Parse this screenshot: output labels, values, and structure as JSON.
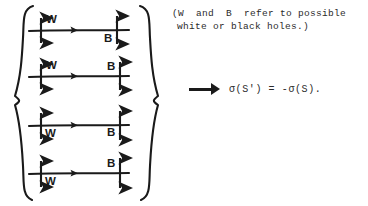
{
  "figure": {
    "left_brace": "{",
    "right_brace": "}",
    "rows": [
      {
        "id": "row-1",
        "left_label": "W",
        "right_label": "B",
        "left_label_position": "above",
        "right_label_position": "below",
        "horizontal_arrow": "rightwards-arrowhead"
      },
      {
        "id": "row-2",
        "left_label": "W",
        "right_label": "B",
        "left_label_position": "above",
        "right_label_position": "above",
        "horizontal_arrow": "rightwards-arrowhead"
      },
      {
        "id": "row-3",
        "left_label": "W",
        "right_label": "B",
        "left_label_position": "below",
        "right_label_position": "below",
        "horizontal_arrow": "rightwards-arrowhead"
      },
      {
        "id": "row-4",
        "left_label": "W",
        "right_label": "B",
        "left_label_position": "below",
        "right_label_position": "above",
        "horizontal_arrow": "rightwards-arrowhead"
      }
    ]
  },
  "note": {
    "line1": "(W  and  B  refer to possible",
    "line2": "white or black holes.)"
  },
  "conclusion": {
    "arrow_symbol": "implies",
    "formula": "σ(S') = -σ(S)."
  },
  "colors": {
    "ink": "#1a1a1a",
    "text": "#2b2b2b",
    "background": "#ffffff"
  }
}
